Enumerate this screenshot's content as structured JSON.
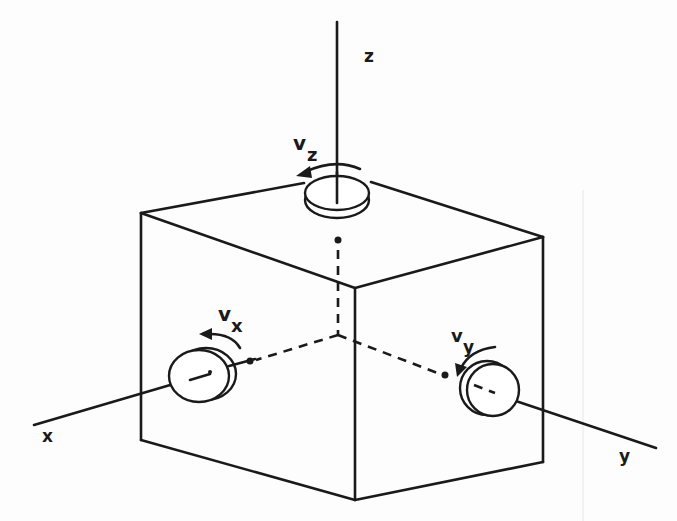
{
  "diagram": {
    "axes": {
      "x": {
        "label": "x"
      },
      "y": {
        "label": "y"
      },
      "z": {
        "label": "z"
      }
    },
    "rotations": {
      "x": {
        "label_main": "v",
        "label_sub": "x"
      },
      "y": {
        "label_main": "v",
        "label_sub": "y"
      },
      "z": {
        "label_main": "v",
        "label_sub": "z"
      }
    },
    "colors": {
      "ink": "#1a1a1a",
      "background": "#fdfdfd"
    }
  }
}
